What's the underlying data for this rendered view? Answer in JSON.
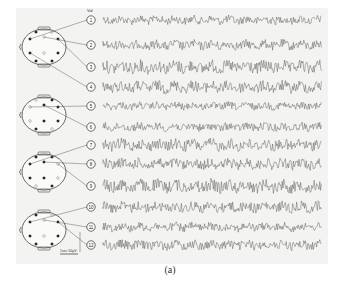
{
  "figure": {
    "caption": "(a)",
    "unit_label": "Volt",
    "scale_bar_label": "1sec 50µV",
    "channels": [
      {
        "n": "1",
        "y": 20,
        "amp": 4
      },
      {
        "n": "2",
        "y": 45,
        "amp": 4.5
      },
      {
        "n": "3",
        "y": 67,
        "amp": 6
      },
      {
        "n": "4",
        "y": 87,
        "amp": 5.5
      },
      {
        "n": "5",
        "y": 106,
        "amp": 3.5
      },
      {
        "n": "6",
        "y": 127,
        "amp": 4
      },
      {
        "n": "7",
        "y": 145,
        "amp": 5.5
      },
      {
        "n": "8",
        "y": 164,
        "amp": 5
      },
      {
        "n": "9",
        "y": 186,
        "amp": 6
      },
      {
        "n": "10",
        "y": 207,
        "amp": 5
      },
      {
        "n": "11",
        "y": 227,
        "amp": 4
      },
      {
        "n": "12",
        "y": 245,
        "amp": 4.5
      }
    ],
    "heads": [
      {
        "cy": 47,
        "channels": [
          "1",
          "2",
          "3",
          "4"
        ]
      },
      {
        "cy": 115,
        "channels": [
          "5",
          "6"
        ]
      },
      {
        "cy": 172,
        "channels": [
          "7",
          "8",
          "9"
        ]
      },
      {
        "cy": 230,
        "channels": [
          "10",
          "11",
          "12"
        ]
      }
    ],
    "colors": {
      "trace": "#3a3a3a",
      "head": "#444444",
      "background": "#f3f3f1"
    }
  }
}
